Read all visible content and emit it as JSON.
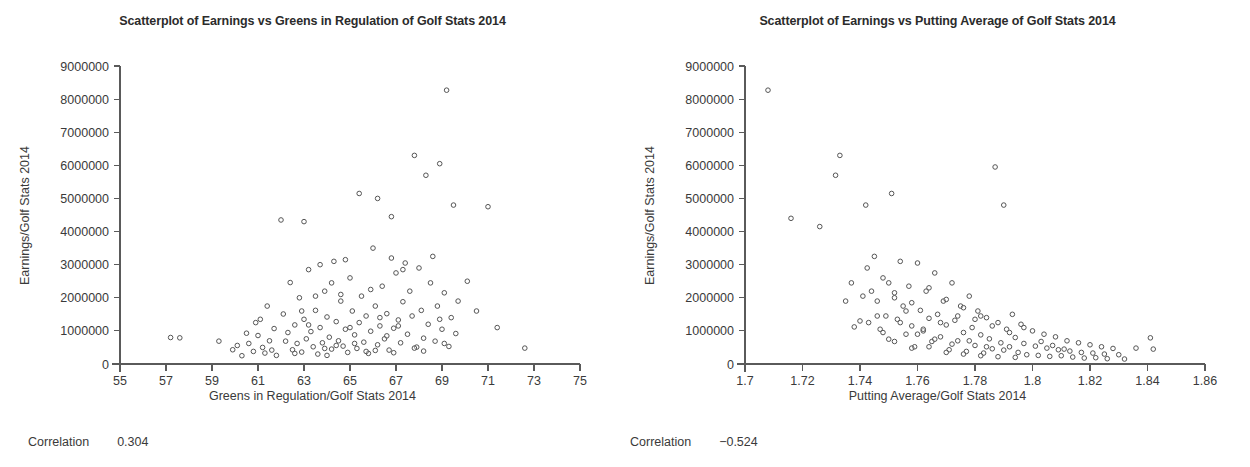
{
  "figure": {
    "width": 1250,
    "height": 467,
    "background": "#ffffff",
    "text_color": "#3a3a3a",
    "marker_color": "#555555",
    "axis_color": "#5a5a5a"
  },
  "panels": [
    {
      "key": "left",
      "title": "Scatterplot of Earnings vs Greens in Regulation of Golf Stats 2014",
      "xlabel": "Greens in Regulation/Golf Stats 2014",
      "ylabel": "Earnings/Golf Stats 2014",
      "correlation_label": "Correlation",
      "correlation_value": "0.304"
    },
    {
      "key": "right",
      "title": "Scatterplot of Earnings vs Putting Average of Golf Stats 2014",
      "xlabel": "Putting Average/Golf Stats 2014",
      "ylabel": "Earnings/Golf Stats 2014",
      "correlation_label": "Correlation",
      "correlation_value": "−0.524"
    }
  ],
  "chart_data": [
    {
      "type": "scatter",
      "panel": "left",
      "title": "Scatterplot of Earnings vs Greens in Regulation of Golf Stats 2014",
      "xlabel": "Greens in Regulation/Golf Stats 2014",
      "ylabel": "Earnings/Golf Stats 2014",
      "xlim": [
        55,
        75
      ],
      "ylim": [
        0,
        9000000
      ],
      "xticks": [
        55,
        57,
        59,
        61,
        63,
        65,
        67,
        69,
        71,
        73,
        75
      ],
      "xticklabels": [
        "55",
        "57",
        "59",
        "61",
        "63",
        "65",
        "67",
        "69",
        "71",
        "73",
        "75"
      ],
      "yticks": [
        0,
        1000000,
        2000000,
        3000000,
        4000000,
        5000000,
        6000000,
        7000000,
        8000000,
        9000000
      ],
      "yticklabels": [
        "0",
        "1000000",
        "2000000",
        "3000000",
        "4000000",
        "5000000",
        "6000000",
        "7000000",
        "8000000",
        "9000000"
      ],
      "grid": false,
      "legend": null,
      "correlation": 0.304,
      "marker": "open-circle",
      "points": [
        [
          57.2,
          800000
        ],
        [
          57.6,
          790000
        ],
        [
          59.3,
          690000
        ],
        [
          59.9,
          430000
        ],
        [
          60.1,
          560000
        ],
        [
          60.3,
          250000
        ],
        [
          60.5,
          930000
        ],
        [
          60.6,
          620000
        ],
        [
          60.8,
          380000
        ],
        [
          60.9,
          1250000
        ],
        [
          61.0,
          860000
        ],
        [
          61.2,
          500000
        ],
        [
          61.3,
          330000
        ],
        [
          61.4,
          1750000
        ],
        [
          61.5,
          700000
        ],
        [
          61.6,
          420000
        ],
        [
          61.7,
          1070000
        ],
        [
          61.8,
          260000
        ],
        [
          62.0,
          4350000
        ],
        [
          62.1,
          1510000
        ],
        [
          62.2,
          690000
        ],
        [
          62.3,
          950000
        ],
        [
          62.4,
          2460000
        ],
        [
          62.5,
          430000
        ],
        [
          62.6,
          1180000
        ],
        [
          62.7,
          620000
        ],
        [
          62.8,
          2000000
        ],
        [
          62.9,
          360000
        ],
        [
          63.0,
          1350000
        ],
        [
          63.1,
          760000
        ],
        [
          63.2,
          2850000
        ],
        [
          63.3,
          980000
        ],
        [
          63.4,
          520000
        ],
        [
          63.5,
          1620000
        ],
        [
          63.6,
          300000
        ],
        [
          63.7,
          1100000
        ],
        [
          63.8,
          640000
        ],
        [
          63.9,
          2200000
        ],
        [
          64.0,
          1420000
        ],
        [
          64.1,
          810000
        ],
        [
          64.2,
          450000
        ],
        [
          64.3,
          3100000
        ],
        [
          64.4,
          1280000
        ],
        [
          64.5,
          700000
        ],
        [
          64.6,
          1900000
        ],
        [
          64.7,
          540000
        ],
        [
          64.8,
          1050000
        ],
        [
          64.9,
          350000
        ],
        [
          65.0,
          2600000
        ],
        [
          65.1,
          1600000
        ],
        [
          65.2,
          880000
        ],
        [
          65.3,
          470000
        ],
        [
          65.4,
          1250000
        ],
        [
          65.5,
          2050000
        ],
        [
          65.6,
          660000
        ],
        [
          65.7,
          1450000
        ],
        [
          65.8,
          320000
        ],
        [
          65.9,
          990000
        ],
        [
          66.0,
          3500000
        ],
        [
          66.1,
          1750000
        ],
        [
          66.2,
          580000
        ],
        [
          66.3,
          1150000
        ],
        [
          66.4,
          2350000
        ],
        [
          66.5,
          760000
        ],
        [
          66.6,
          1520000
        ],
        [
          66.7,
          420000
        ],
        [
          66.8,
          4450000
        ],
        [
          66.9,
          1080000
        ],
        [
          67.0,
          2750000
        ],
        [
          67.1,
          1330000
        ],
        [
          67.2,
          640000
        ],
        [
          67.3,
          1880000
        ],
        [
          67.4,
          3050000
        ],
        [
          67.5,
          900000
        ],
        [
          67.6,
          2200000
        ],
        [
          67.7,
          1450000
        ],
        [
          67.8,
          6300000
        ],
        [
          67.9,
          510000
        ],
        [
          68.0,
          2900000
        ],
        [
          68.1,
          1620000
        ],
        [
          68.2,
          780000
        ],
        [
          68.3,
          5700000
        ],
        [
          68.4,
          1200000
        ],
        [
          68.5,
          2450000
        ],
        [
          68.6,
          3250000
        ],
        [
          68.7,
          690000
        ],
        [
          68.8,
          1750000
        ],
        [
          68.9,
          6050000
        ],
        [
          69.0,
          1050000
        ],
        [
          69.1,
          2150000
        ],
        [
          69.2,
          8270000
        ],
        [
          69.3,
          530000
        ],
        [
          69.4,
          1400000
        ],
        [
          69.5,
          4800000
        ],
        [
          69.6,
          920000
        ],
        [
          69.7,
          1900000
        ],
        [
          70.1,
          2500000
        ],
        [
          70.5,
          1600000
        ],
        [
          71.0,
          4750000
        ],
        [
          71.4,
          1100000
        ],
        [
          72.6,
          480000
        ],
        [
          63.2,
          1180000
        ],
        [
          64.6,
          2100000
        ],
        [
          65.2,
          620000
        ],
        [
          66.1,
          410000
        ],
        [
          63.9,
          470000
        ],
        [
          65.7,
          380000
        ],
        [
          64.4,
          560000
        ],
        [
          66.9,
          340000
        ],
        [
          62.6,
          320000
        ],
        [
          67.8,
          480000
        ],
        [
          68.2,
          390000
        ],
        [
          64.0,
          260000
        ],
        [
          65.0,
          1100000
        ],
        [
          66.3,
          1400000
        ],
        [
          63.5,
          2050000
        ],
        [
          64.8,
          3150000
        ],
        [
          67.1,
          1150000
        ],
        [
          65.9,
          2250000
        ],
        [
          66.6,
          850000
        ],
        [
          62.9,
          1600000
        ],
        [
          61.1,
          1350000
        ],
        [
          63.0,
          4300000
        ],
        [
          65.4,
          5150000
        ],
        [
          66.2,
          5000000
        ],
        [
          68.9,
          1350000
        ],
        [
          69.1,
          620000
        ],
        [
          63.7,
          3000000
        ],
        [
          64.2,
          2450000
        ],
        [
          66.8,
          3200000
        ],
        [
          67.3,
          2850000
        ]
      ]
    },
    {
      "type": "scatter",
      "panel": "right",
      "title": "Scatterplot of Earnings vs Putting Average of Golf Stats 2014",
      "xlabel": "Putting Average/Golf Stats 2014",
      "ylabel": "Earnings/Golf Stats 2014",
      "xlim": [
        1.7,
        1.86
      ],
      "ylim": [
        0,
        9000000
      ],
      "xticks": [
        1.7,
        1.72,
        1.74,
        1.76,
        1.78,
        1.8,
        1.82,
        1.84,
        1.86
      ],
      "xticklabels": [
        "1.7",
        "1.72",
        "1.74",
        "1.76",
        "1.78",
        "1.8",
        "1.82",
        "1.84",
        "1.86"
      ],
      "yticks": [
        0,
        1000000,
        2000000,
        3000000,
        4000000,
        5000000,
        6000000,
        7000000,
        8000000,
        9000000
      ],
      "yticklabels": [
        "0",
        "1000000",
        "2000000",
        "3000000",
        "4000000",
        "5000000",
        "6000000",
        "7000000",
        "8000000",
        "9000000"
      ],
      "grid": false,
      "legend": null,
      "correlation": -0.524,
      "marker": "open-circle",
      "points": [
        [
          1.708,
          8270000
        ],
        [
          1.716,
          4400000
        ],
        [
          1.726,
          4150000
        ],
        [
          1.733,
          6300000
        ],
        [
          1.7315,
          5700000
        ],
        [
          1.737,
          2450000
        ],
        [
          1.738,
          1120000
        ],
        [
          1.742,
          4800000
        ],
        [
          1.7425,
          2900000
        ],
        [
          1.743,
          1250000
        ],
        [
          1.745,
          3250000
        ],
        [
          1.746,
          1900000
        ],
        [
          1.747,
          1050000
        ],
        [
          1.748,
          2600000
        ],
        [
          1.749,
          1450000
        ],
        [
          1.75,
          750000
        ],
        [
          1.751,
          5150000
        ],
        [
          1.752,
          2150000
        ],
        [
          1.753,
          1350000
        ],
        [
          1.754,
          3100000
        ],
        [
          1.755,
          1750000
        ],
        [
          1.756,
          900000
        ],
        [
          1.757,
          2350000
        ],
        [
          1.758,
          1150000
        ],
        [
          1.759,
          520000
        ],
        [
          1.76,
          3050000
        ],
        [
          1.761,
          1620000
        ],
        [
          1.762,
          1000000
        ],
        [
          1.763,
          2200000
        ],
        [
          1.764,
          1380000
        ],
        [
          1.765,
          680000
        ],
        [
          1.766,
          2750000
        ],
        [
          1.767,
          1500000
        ],
        [
          1.768,
          820000
        ],
        [
          1.769,
          1900000
        ],
        [
          1.77,
          1180000
        ],
        [
          1.771,
          430000
        ],
        [
          1.772,
          2450000
        ],
        [
          1.773,
          1320000
        ],
        [
          1.774,
          700000
        ],
        [
          1.775,
          1750000
        ],
        [
          1.776,
          950000
        ],
        [
          1.777,
          380000
        ],
        [
          1.778,
          2050000
        ],
        [
          1.779,
          1100000
        ],
        [
          1.78,
          560000
        ],
        [
          1.781,
          1600000
        ],
        [
          1.782,
          880000
        ],
        [
          1.783,
          330000
        ],
        [
          1.784,
          1400000
        ],
        [
          1.785,
          760000
        ],
        [
          1.786,
          460000
        ],
        [
          1.787,
          5950000
        ],
        [
          1.788,
          1250000
        ],
        [
          1.789,
          640000
        ],
        [
          1.79,
          4800000
        ],
        [
          1.791,
          1050000
        ],
        [
          1.792,
          520000
        ],
        [
          1.793,
          1500000
        ],
        [
          1.794,
          800000
        ],
        [
          1.795,
          350000
        ],
        [
          1.796,
          1200000
        ],
        [
          1.797,
          620000
        ],
        [
          1.798,
          280000
        ],
        [
          1.8,
          1000000
        ],
        [
          1.801,
          540000
        ],
        [
          1.802,
          260000
        ],
        [
          1.804,
          900000
        ],
        [
          1.805,
          480000
        ],
        [
          1.806,
          230000
        ],
        [
          1.808,
          820000
        ],
        [
          1.809,
          430000
        ],
        [
          1.81,
          250000
        ],
        [
          1.812,
          700000
        ],
        [
          1.813,
          390000
        ],
        [
          1.814,
          210000
        ],
        [
          1.816,
          640000
        ],
        [
          1.817,
          350000
        ],
        [
          1.818,
          180000
        ],
        [
          1.82,
          580000
        ],
        [
          1.821,
          330000
        ],
        [
          1.822,
          190000
        ],
        [
          1.824,
          520000
        ],
        [
          1.825,
          300000
        ],
        [
          1.826,
          160000
        ],
        [
          1.828,
          470000
        ],
        [
          1.83,
          280000
        ],
        [
          1.832,
          150000
        ],
        [
          1.836,
          480000
        ],
        [
          1.841,
          790000
        ],
        [
          1.842,
          450000
        ],
        [
          1.752,
          2000000
        ],
        [
          1.758,
          1850000
        ],
        [
          1.764,
          2300000
        ],
        [
          1.77,
          1950000
        ],
        [
          1.776,
          1700000
        ],
        [
          1.782,
          1450000
        ],
        [
          1.744,
          2200000
        ],
        [
          1.75,
          2450000
        ],
        [
          1.756,
          1600000
        ],
        [
          1.762,
          1050000
        ],
        [
          1.768,
          1250000
        ],
        [
          1.774,
          1450000
        ],
        [
          1.78,
          1350000
        ],
        [
          1.786,
          1150000
        ],
        [
          1.792,
          950000
        ],
        [
          1.74,
          1300000
        ],
        [
          1.746,
          1450000
        ],
        [
          1.754,
          1250000
        ],
        [
          1.76,
          900000
        ],
        [
          1.766,
          750000
        ],
        [
          1.772,
          600000
        ],
        [
          1.778,
          700000
        ],
        [
          1.784,
          520000
        ],
        [
          1.79,
          420000
        ],
        [
          1.748,
          950000
        ],
        [
          1.752,
          680000
        ],
        [
          1.758,
          480000
        ],
        [
          1.764,
          520000
        ],
        [
          1.77,
          350000
        ],
        [
          1.776,
          300000
        ],
        [
          1.782,
          250000
        ],
        [
          1.788,
          220000
        ],
        [
          1.794,
          200000
        ],
        [
          1.735,
          1900000
        ],
        [
          1.741,
          2050000
        ],
        [
          1.797,
          1100000
        ],
        [
          1.803,
          680000
        ],
        [
          1.807,
          560000
        ],
        [
          1.811,
          450000
        ]
      ]
    }
  ]
}
